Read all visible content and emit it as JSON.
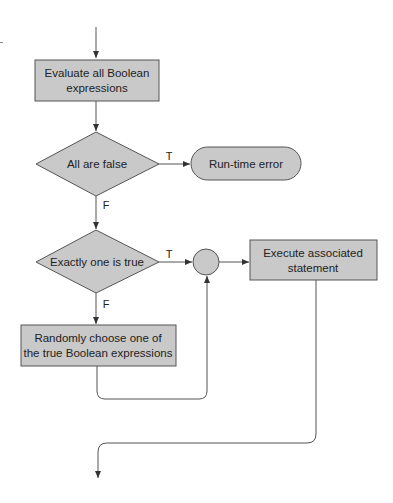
{
  "diagram": {
    "type": "flowchart",
    "colors": {
      "fill": "#c9c9c9",
      "stroke": "#555555",
      "text": "#222222"
    },
    "nodes": {
      "evaluate": {
        "shape": "rectangle",
        "line1": "Evaluate all Boolean",
        "line2": "expressions"
      },
      "all_false": {
        "shape": "diamond",
        "label": "All are false"
      },
      "runtime_error": {
        "shape": "terminator",
        "label": "Run-time error"
      },
      "exactly_one": {
        "shape": "diamond",
        "label": "Exactly one is true"
      },
      "junction": {
        "shape": "circle"
      },
      "execute": {
        "shape": "rectangle",
        "line1": "Execute associated",
        "line2": "statement"
      },
      "random_choose": {
        "shape": "rectangle",
        "line1": "Randomly choose one of",
        "line2": "the true Boolean expressions"
      }
    },
    "edges": {
      "all_false_true": "T",
      "all_false_false": "F",
      "exactly_one_true": "T",
      "exactly_one_false": "F"
    }
  }
}
